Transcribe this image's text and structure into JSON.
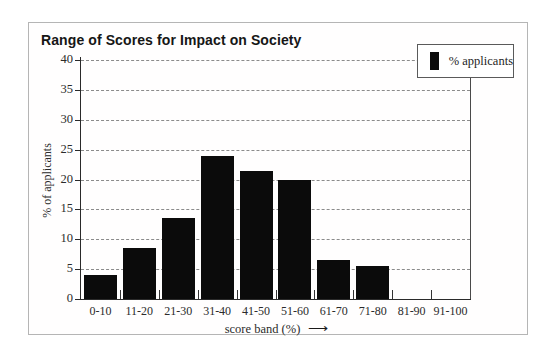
{
  "title": "Range of Scores for Impact on Society",
  "legend": {
    "label": "% applicants",
    "swatch_color": "#0b0b0b",
    "position": "top-right"
  },
  "icons": {
    "right_arrow": "⟶"
  },
  "chart_data": {
    "type": "bar",
    "title": "Range of Scores for Impact on Society",
    "categories": [
      "0-10",
      "11-20",
      "21-30",
      "31-40",
      "41-50",
      "51-60",
      "61-70",
      "71-80",
      "81-90",
      "91-100"
    ],
    "values": [
      4,
      8.5,
      13.5,
      24,
      21.5,
      20,
      6.5,
      5.5,
      0,
      0
    ],
    "xlabel": "score band (%)",
    "ylabel": "% of applicants",
    "ylim": [
      0,
      40
    ],
    "yticks": [
      0,
      5,
      10,
      15,
      20,
      25,
      30,
      35,
      40
    ],
    "grid": "horizontal-dashed",
    "bar_color": "#0b0b0b",
    "legend_entries": [
      "% applicants"
    ]
  }
}
